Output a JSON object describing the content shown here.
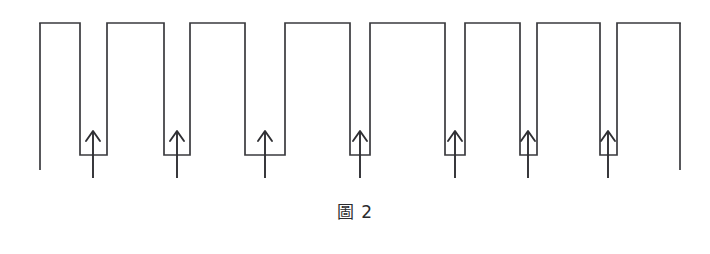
{
  "figure": {
    "caption": "圖 2",
    "caption_label": "圖",
    "caption_number": "2",
    "colors": {
      "background": "#ffffff",
      "stroke": "#3a3a3e",
      "arrow": "#2f2f33",
      "caption_text": "#2b2b2e"
    },
    "geometry": {
      "canvas_width": 710,
      "canvas_height": 254,
      "plot_width": 710,
      "plot_height": 195,
      "high_level_y": 23,
      "low_level_y": 155,
      "left_stem_bottom_y": 170,
      "right_stem_bottom_y": 170,
      "arrow_stem_bottom_y": 178,
      "arrow_head_top_y": 131,
      "stroke_width": 1.7
    }
  },
  "chart_data": {
    "type": "line",
    "title": "圖 2",
    "subtitle": "",
    "xlabel": "",
    "ylabel": "",
    "grid": false,
    "legend": null,
    "xlim": [
      0,
      710
    ],
    "ylim": [
      0,
      195
    ],
    "levels": {
      "high": 23,
      "low": 155
    },
    "pulse_count": 8,
    "notch_count": 7,
    "arrow_count": 7,
    "high_segments": [
      {
        "index": 1,
        "x_start": 40,
        "x_end": 80,
        "y": 23,
        "width": 40
      },
      {
        "index": 2,
        "x_start": 107,
        "x_end": 164,
        "y": 23,
        "width": 57
      },
      {
        "index": 3,
        "x_start": 190,
        "x_end": 245,
        "y": 23,
        "width": 55
      },
      {
        "index": 4,
        "x_start": 285,
        "x_end": 350,
        "y": 23,
        "width": 65
      },
      {
        "index": 5,
        "x_start": 370,
        "x_end": 445,
        "y": 23,
        "width": 75
      },
      {
        "index": 6,
        "x_start": 465,
        "x_end": 520,
        "y": 23,
        "width": 55
      },
      {
        "index": 7,
        "x_start": 537,
        "x_end": 600,
        "y": 23,
        "width": 63
      },
      {
        "index": 8,
        "x_start": 617,
        "x_end": 680,
        "y": 23,
        "width": 63
      }
    ],
    "low_segments": [
      {
        "index": 1,
        "x_start": 80,
        "x_end": 107,
        "y": 155,
        "width": 27
      },
      {
        "index": 2,
        "x_start": 164,
        "x_end": 190,
        "y": 155,
        "width": 26
      },
      {
        "index": 3,
        "x_start": 245,
        "x_end": 285,
        "y": 155,
        "width": 40
      },
      {
        "index": 4,
        "x_start": 350,
        "x_end": 370,
        "y": 155,
        "width": 20
      },
      {
        "index": 5,
        "x_start": 445,
        "x_end": 465,
        "y": 155,
        "width": 20
      },
      {
        "index": 6,
        "x_start": 520,
        "x_end": 537,
        "y": 155,
        "width": 17
      },
      {
        "index": 7,
        "x_start": 600,
        "x_end": 617,
        "y": 155,
        "width": 17
      }
    ],
    "arrows": [
      {
        "index": 1,
        "x": 93,
        "y_tail": 178,
        "y_tip": 131,
        "direction": "up"
      },
      {
        "index": 2,
        "x": 177,
        "y_tail": 178,
        "y_tip": 131,
        "direction": "up"
      },
      {
        "index": 3,
        "x": 265,
        "y_tail": 178,
        "y_tip": 131,
        "direction": "up"
      },
      {
        "index": 4,
        "x": 360,
        "y_tail": 178,
        "y_tip": 131,
        "direction": "up"
      },
      {
        "index": 5,
        "x": 455,
        "y_tail": 178,
        "y_tip": 131,
        "direction": "up"
      },
      {
        "index": 6,
        "x": 528,
        "y_tail": 178,
        "y_tip": 131,
        "direction": "up"
      },
      {
        "index": 7,
        "x": 608,
        "y_tail": 178,
        "y_tip": 131,
        "direction": "up"
      }
    ],
    "open_stems": [
      {
        "name": "left-edge-stem",
        "x": 40,
        "y_top": 23,
        "y_bottom": 170
      },
      {
        "name": "right-edge-stem",
        "x": 680,
        "y_top": 23,
        "y_bottom": 170
      }
    ]
  }
}
